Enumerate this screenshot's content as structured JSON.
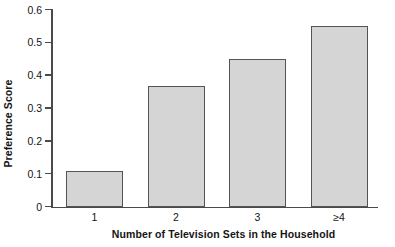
{
  "chart_data": {
    "type": "bar",
    "title": "",
    "categories": [
      "1",
      "2",
      "3",
      "≥4"
    ],
    "values": [
      0.11,
      0.37,
      0.45,
      0.55
    ],
    "xlabel": "Number of Television Sets in the Household",
    "ylabel": "Preference Score",
    "ylim": [
      0,
      0.6
    ],
    "yticks": [
      "0",
      "0.1",
      "0.2",
      "0.3",
      "0.4",
      "0.5",
      "0.6"
    ],
    "ytick_values": [
      0,
      0.1,
      0.2,
      0.3,
      0.4,
      0.5,
      0.6
    ],
    "grid": false,
    "legend": null,
    "bar_fill_color": "#d5d5d5",
    "bar_border_color": "#545454",
    "axis_color": "#4a4a4a",
    "text_color": "#141414"
  }
}
